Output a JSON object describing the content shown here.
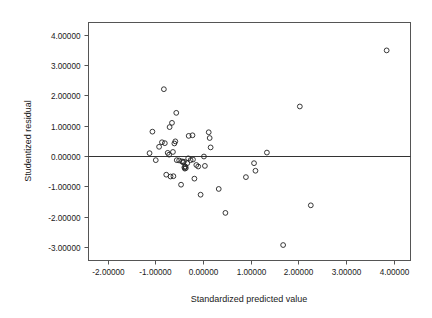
{
  "chart_data": {
    "type": "scatter",
    "title": "",
    "xlabel": "Standardized predicted value",
    "ylabel": "Studentized residual",
    "xlim": [
      -2.4,
      4.35
    ],
    "ylim": [
      -3.45,
      4.4
    ],
    "xticks": [
      -2,
      -1,
      0,
      1,
      2,
      3,
      4
    ],
    "yticks": [
      -3,
      -2,
      -1,
      0,
      1,
      2,
      3,
      4
    ],
    "xticklabels": [
      "-2.00000",
      "-1.00000",
      "0.00000",
      "1.00000",
      "2.00000",
      "3.00000",
      "4.00000"
    ],
    "yticklabels": [
      "-3.00000",
      "-2.00000",
      "-1.00000",
      "0.00000",
      "1.00000",
      "2.00000",
      "3.00000",
      "4.00000"
    ],
    "grid": false,
    "legend": null,
    "reference_lines": [
      {
        "axis": "horizontal",
        "value": 0,
        "label": "zero-residual-line"
      }
    ],
    "marker": "open-circle",
    "marker_color": "#222222",
    "points": [
      {
        "x": -1.12,
        "y": 0.09
      },
      {
        "x": -1.06,
        "y": 0.8
      },
      {
        "x": -0.99,
        "y": -0.14
      },
      {
        "x": -0.92,
        "y": 0.3
      },
      {
        "x": -0.86,
        "y": 0.45
      },
      {
        "x": -0.82,
        "y": 2.2
      },
      {
        "x": -0.8,
        "y": 0.42
      },
      {
        "x": -0.77,
        "y": -0.62
      },
      {
        "x": -0.74,
        "y": 0.1
      },
      {
        "x": -0.71,
        "y": 0.04
      },
      {
        "x": -0.7,
        "y": 0.95
      },
      {
        "x": -0.68,
        "y": -0.68
      },
      {
        "x": -0.65,
        "y": 1.09
      },
      {
        "x": -0.63,
        "y": 0.13
      },
      {
        "x": -0.62,
        "y": -0.67
      },
      {
        "x": -0.6,
        "y": 0.41
      },
      {
        "x": -0.58,
        "y": 0.48
      },
      {
        "x": -0.56,
        "y": 1.42
      },
      {
        "x": -0.55,
        "y": -0.14
      },
      {
        "x": -0.5,
        "y": -0.15
      },
      {
        "x": -0.46,
        "y": -0.95
      },
      {
        "x": -0.44,
        "y": -0.18
      },
      {
        "x": -0.42,
        "y": -0.21
      },
      {
        "x": -0.4,
        "y": -0.19
      },
      {
        "x": -0.39,
        "y": -0.38
      },
      {
        "x": -0.38,
        "y": -0.42
      },
      {
        "x": -0.37,
        "y": -0.35
      },
      {
        "x": -0.36,
        "y": -0.4
      },
      {
        "x": -0.33,
        "y": -0.24
      },
      {
        "x": -0.31,
        "y": -0.08
      },
      {
        "x": -0.3,
        "y": 0.66
      },
      {
        "x": -0.26,
        "y": -0.14
      },
      {
        "x": -0.22,
        "y": 0.68
      },
      {
        "x": -0.21,
        "y": -0.12
      },
      {
        "x": -0.18,
        "y": -0.75
      },
      {
        "x": -0.14,
        "y": -0.3
      },
      {
        "x": -0.1,
        "y": -0.35
      },
      {
        "x": -0.05,
        "y": -1.28
      },
      {
        "x": 0.02,
        "y": -0.02
      },
      {
        "x": 0.04,
        "y": -0.33
      },
      {
        "x": 0.12,
        "y": 0.78
      },
      {
        "x": 0.14,
        "y": 0.59
      },
      {
        "x": 0.16,
        "y": 0.28
      },
      {
        "x": 0.33,
        "y": -1.09
      },
      {
        "x": 0.47,
        "y": -1.88
      },
      {
        "x": 0.9,
        "y": -0.7
      },
      {
        "x": 1.07,
        "y": -0.24
      },
      {
        "x": 1.1,
        "y": -0.49
      },
      {
        "x": 1.34,
        "y": 0.11
      },
      {
        "x": 1.68,
        "y": -2.94
      },
      {
        "x": 2.03,
        "y": 1.63
      },
      {
        "x": 2.26,
        "y": -1.63
      },
      {
        "x": 3.85,
        "y": 3.48
      }
    ]
  }
}
